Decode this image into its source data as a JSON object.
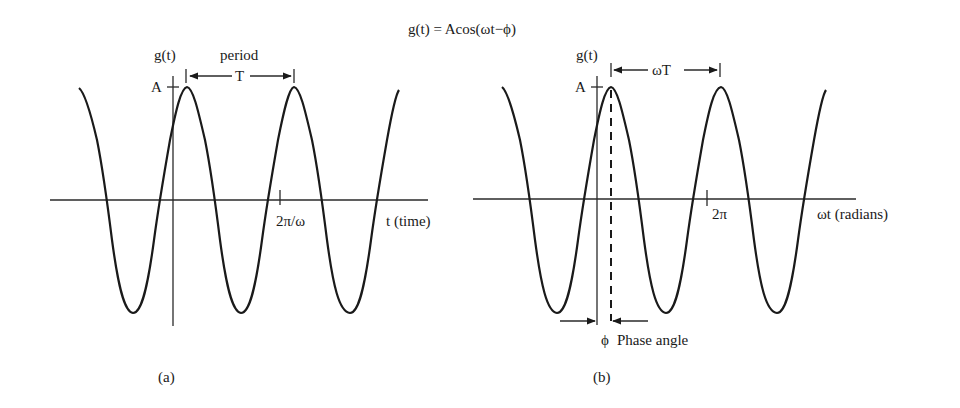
{
  "title": "g(t) = Acos(ωt−ϕ)",
  "panel_a": {
    "caption": "(a)",
    "y_axis_label": "g(t)",
    "amplitude_label": "A",
    "period_label": "period",
    "period_symbol": "T",
    "x_tick_label": "2π/ω",
    "x_axis_label": "t (time)"
  },
  "panel_b": {
    "caption": "(b)",
    "y_axis_label": "g(t)",
    "amplitude_label": "A",
    "period_symbol": "ωT",
    "x_tick_label": "2π",
    "x_axis_label": "ωt (radians)",
    "phase_symbol": "ϕ",
    "phase_label": "Phase angle"
  },
  "colors": {
    "ink": "#1a1a1a",
    "background": "#ffffff"
  }
}
